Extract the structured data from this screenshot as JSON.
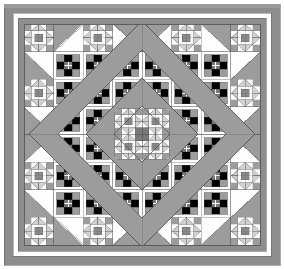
{
  "figure": {
    "name": "quilt-pattern-diagram",
    "kind": "quilt-block-layout",
    "width": 284,
    "height": 269,
    "background": "#ffffff"
  },
  "palette": {
    "background": "#ffffff",
    "outer_frame": "#8e8e8e",
    "outer_frame_top": "#9a9a9a",
    "inner_border": "#8e8e8e",
    "sashing_gap": "#ffffff",
    "dark_gray": "#6f6f6f",
    "medium_gray": "#9c9c9c",
    "light_gray": "#d0d0d0",
    "pale_gray": "#e6e6e6",
    "white": "#fdfdfd",
    "line": "#555555",
    "center_hub": "#7a7a7a"
  },
  "frame": {
    "outer": {
      "x": 4,
      "y": 4,
      "width": 276,
      "height": 261,
      "thickness": 9,
      "color": "#8e8e8e"
    },
    "gap": {
      "x": 13,
      "y": 13,
      "width": 258,
      "height": 243,
      "color": "#ffffff"
    },
    "inner": {
      "x": 18,
      "y": 18,
      "width": 248,
      "height": 233,
      "thickness": 6,
      "color": "#8e8e8e"
    },
    "field": {
      "x": 24,
      "y": 24,
      "width": 236,
      "height": 221
    }
  },
  "grid": {
    "columns": 8,
    "rows": 8,
    "cell_width": 29.5,
    "cell_height": 27.6,
    "block_types": [
      [
        "star",
        "hst-nw",
        "star",
        "hst-ne",
        "hst-nw",
        "star",
        "hst-ne",
        "star"
      ],
      [
        "hst-sw",
        "ninepatch",
        "diamond",
        "ninepatch",
        "ninepatch",
        "diamond",
        "ninepatch",
        "hst-se"
      ],
      [
        "star",
        "diamond",
        "ninepatch",
        "diamond",
        "diamond",
        "ninepatch",
        "diamond",
        "star"
      ],
      [
        "hst-sw",
        "ninepatch",
        "diamond",
        "center",
        "center",
        "diamond",
        "ninepatch",
        "hst-se"
      ],
      [
        "hst-nw",
        "ninepatch",
        "diamond",
        "center",
        "center",
        "diamond",
        "ninepatch",
        "hst-ne"
      ],
      [
        "star",
        "diamond",
        "ninepatch",
        "diamond",
        "diamond",
        "ninepatch",
        "diamond",
        "star"
      ],
      [
        "hst-sw",
        "ninepatch",
        "diamond",
        "ninepatch",
        "ninepatch",
        "diamond",
        "ninepatch",
        "hst-se"
      ],
      [
        "star",
        "hst-sw",
        "star",
        "hst-se",
        "hst-sw",
        "star",
        "hst-se",
        "star"
      ]
    ]
  },
  "medallion": {
    "description": "Concentric on-point diamonds (squares rotated 45 degrees) centered in the quilt field",
    "center": {
      "x": 142,
      "y": 134
    },
    "rings": [
      {
        "name": "outer-diamond",
        "half_diagonal": 113,
        "fill": "#9c9c9c",
        "stroke": "#555555"
      },
      {
        "name": "middle-diamond",
        "half_diagonal": 84,
        "fill": "#ffffff",
        "stroke": "#555555"
      },
      {
        "name": "inner-diamond",
        "half_diagonal": 56,
        "fill": "#9c9c9c",
        "stroke": "#555555"
      },
      {
        "name": "core-diamond",
        "half_diagonal": 28,
        "fill": "#ffffff",
        "stroke": "#555555"
      }
    ]
  },
  "blocks": {
    "star": {
      "label": "sawtooth-star-block",
      "grid": 4,
      "corner_fill": "#9c9c9c",
      "point_fill": "#d0d0d0",
      "center_fill": "#8a8a8a",
      "ground_fill": "#fdfdfd"
    },
    "ninepatch": {
      "label": "nine-patch-cross-block",
      "grid": 3,
      "corner_fill": "#9c9c9c",
      "cross_fill": "#7a7a7a",
      "ground_fill": "#fdfdfd"
    },
    "hst": {
      "label": "half-square-triangle-block",
      "triangle_fill": "#9c9c9c",
      "ground_fill": "#fdfdfd"
    },
    "center": {
      "label": "center-medallion-block",
      "hub_fill": "#7a7a7a"
    }
  },
  "counts": {
    "total_blocks": 64,
    "star_blocks": 16,
    "ninepatch_blocks": 16,
    "hst_blocks": 16
  },
  "labels": {
    "title": "",
    "caption": ""
  }
}
